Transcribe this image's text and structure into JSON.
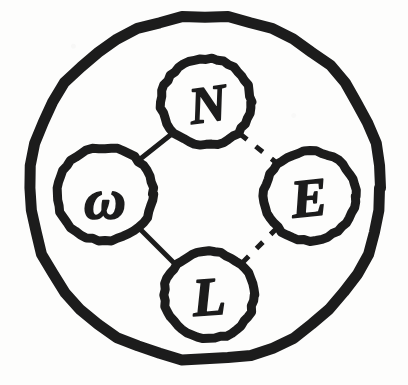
{
  "figure": {
    "kind": "hand-drawn-diagram",
    "ink_color": "#1c1c1c",
    "paper_color": "#fdfdfc"
  },
  "outer_circle": {
    "name": "outer-boundary-circle",
    "cx": 205,
    "cy": 188,
    "rx": 176,
    "ry": 172,
    "stroke_width": 11
  },
  "nodes": [
    {
      "id": "north",
      "label": "N",
      "cx": 206,
      "cy": 102,
      "r": 45,
      "stroke_width": 9,
      "font_size": 52,
      "label_dx": 2,
      "label_dy": 2,
      "label_rotate": -8
    },
    {
      "id": "west",
      "label": "ω",
      "cx": 105,
      "cy": 194,
      "r": 48,
      "stroke_width": 9,
      "font_size": 58,
      "label_dx": 0,
      "label_dy": 4,
      "label_rotate": 0
    },
    {
      "id": "east",
      "label": "E",
      "cx": 310,
      "cy": 196,
      "r": 46,
      "stroke_width": 9,
      "font_size": 54,
      "label_dx": -1,
      "label_dy": 2,
      "label_rotate": -6
    },
    {
      "id": "south",
      "label": "L",
      "cx": 209,
      "cy": 295,
      "r": 45,
      "stroke_width": 9,
      "font_size": 54,
      "label_dx": 0,
      "label_dy": 2,
      "label_rotate": -4
    }
  ],
  "edges": [
    {
      "id": "west-north",
      "from": "west",
      "to": "north",
      "style": "solid",
      "stroke_width": 5,
      "x1": 139,
      "y1": 160,
      "x2": 173,
      "y2": 133
    },
    {
      "id": "west-south",
      "from": "west",
      "to": "south",
      "style": "solid",
      "stroke_width": 5,
      "x1": 139,
      "y1": 228,
      "x2": 176,
      "y2": 265
    },
    {
      "id": "north-east",
      "from": "north",
      "to": "east",
      "style": "dashed",
      "stroke_width": 5,
      "dash": "9 11",
      "x1": 240,
      "y1": 134,
      "x2": 278,
      "y2": 164
    },
    {
      "id": "east-south",
      "from": "east",
      "to": "south",
      "style": "dashed",
      "stroke_width": 5,
      "dash": "9 11",
      "x1": 277,
      "y1": 228,
      "x2": 242,
      "y2": 263
    }
  ],
  "legend_note": "Solid edges on the left (W-N, W-L); dashed edges on the right (N-E, E-L)"
}
